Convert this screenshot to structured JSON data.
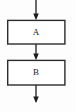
{
  "diagram": {
    "type": "flowchart",
    "orientation": "vertical-top-to-bottom",
    "background_color": "#fdfdfd",
    "stroke_color": "#2b2b2b",
    "node_fill_color": "#ffffff",
    "label_color": "#1a1a1a",
    "nodes": [
      {
        "id": "A",
        "label": "A",
        "shape": "rectangle",
        "x": 7,
        "y": 20,
        "width": 58,
        "height": 24,
        "center_x": 36,
        "center_y": 32
      },
      {
        "id": "B",
        "label": "B",
        "shape": "rectangle",
        "x": 7,
        "y": 60,
        "width": 58,
        "height": 25,
        "center_x": 36,
        "center_y": 72.5
      }
    ],
    "edges": [
      {
        "id": "entry-arrow",
        "label": "",
        "from": "start",
        "to": "A",
        "x": 36,
        "y_start": 0,
        "y_end": 20,
        "arrowhead": "filled-triangle-down"
      },
      {
        "id": "a-to-b-arrow",
        "label": "",
        "from": "A",
        "to": "B",
        "x": 36,
        "y_start": 44,
        "y_end": 60,
        "arrowhead": "filled-triangle-down"
      },
      {
        "id": "exit-arrow",
        "label": "",
        "from": "B",
        "to": "end",
        "x": 36,
        "y_start": 85,
        "y_end": 103,
        "arrowhead": "filled-triangle-down"
      }
    ],
    "axis_x": 36
  }
}
